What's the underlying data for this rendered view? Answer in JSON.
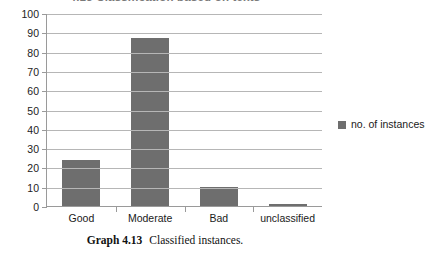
{
  "figure": {
    "title": "4.13 Classification based on texts",
    "caption_label": "Graph 4.13",
    "caption_text": "Classified instances."
  },
  "legend": {
    "position": "right",
    "swatch_name": "no-of-instances-swatch",
    "entries": [
      {
        "label": "no. of instances",
        "color": "#6e6e6e"
      }
    ]
  },
  "axes": {
    "y_ticks": [
      "100",
      "90",
      "80",
      "70",
      "60",
      "50",
      "40",
      "30",
      "20",
      "10",
      "0"
    ],
    "x_ticks": [
      "Good",
      "Moderate",
      "Bad",
      "unclassified"
    ]
  },
  "chart_data": {
    "type": "bar",
    "title": "4.13 Classification based on texts",
    "categories": [
      "Good",
      "Moderate",
      "Bad",
      "unclassified"
    ],
    "series": [
      {
        "name": "no. of instances",
        "values": [
          24,
          87,
          10,
          1
        ],
        "color": "#6e6e6e"
      }
    ],
    "xlabel": "",
    "ylabel": "",
    "ylim": [
      0,
      100
    ],
    "ytick_step": 10,
    "grid": true,
    "legend_position": "right"
  }
}
